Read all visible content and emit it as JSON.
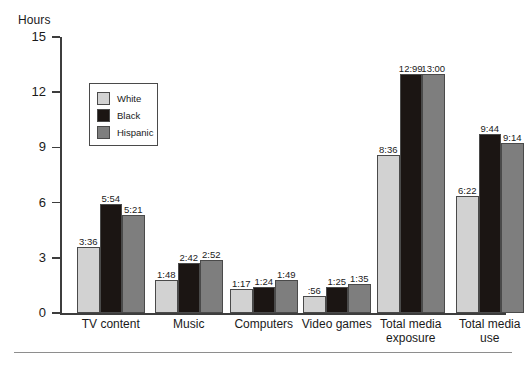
{
  "chart_data": {
    "type": "bar",
    "title": "",
    "subtitle": "",
    "xlabel": "",
    "ylabel": "Hours",
    "ylim": [
      0,
      15
    ],
    "yticks": [
      0,
      3,
      6,
      9,
      12,
      15
    ],
    "ytick_labels": [
      "0",
      "3",
      "6",
      "9",
      "12",
      "15"
    ],
    "grid": false,
    "legend_position": "upper-left-inside",
    "categories": [
      "TV content",
      "Music",
      "Computers",
      "Video games",
      "Total media\nexposure",
      "Total media\nuse"
    ],
    "series": [
      {
        "name": "White",
        "color": "#d2d2d2",
        "values": [
          3.6,
          1.8,
          1.283,
          0.933,
          8.6,
          6.367
        ],
        "labels": [
          "3:36",
          "1:48",
          "1:17",
          ":56",
          "8:36",
          "6:22"
        ]
      },
      {
        "name": "Black",
        "color": "#1b1513",
        "values": [
          5.9,
          2.7,
          1.4,
          1.417,
          13.0,
          9.733
        ],
        "labels": [
          "5:54",
          "2:42",
          "1:24",
          "1:25",
          "12:99",
          "9:44"
        ]
      },
      {
        "name": "Hispanic",
        "color": "#7e7e7e",
        "values": [
          5.35,
          2.867,
          1.817,
          1.583,
          13.0,
          9.233
        ],
        "labels": [
          "5:21",
          "2:52",
          "1:49",
          "1:35",
          "13:00",
          "9:14"
        ]
      }
    ]
  },
  "legend": {
    "items": [
      {
        "label": "White",
        "swatch": "white"
      },
      {
        "label": "Black",
        "swatch": "black"
      },
      {
        "label": "Hispanic",
        "swatch": "hispanic"
      }
    ]
  },
  "colors": {
    "white_series": "#d2d2d2",
    "black_series": "#1b1513",
    "hispanic_series": "#7e7e7e",
    "axis": "#3d3d3d",
    "rule": "#8e8e8e",
    "background": "#ffffff"
  }
}
